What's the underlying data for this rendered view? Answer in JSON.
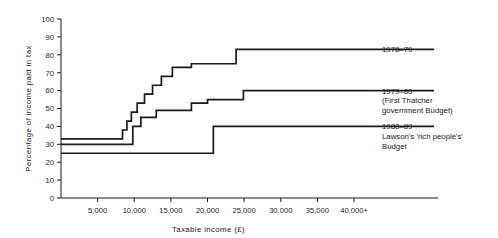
{
  "chart_data": {
    "type": "line",
    "subtype": "step",
    "title": "",
    "xlabel": "Taxable income (£)",
    "ylabel": "Percentage of income paid in tax",
    "grid": false,
    "legend_position": "right",
    "xlim": [
      0,
      43000
    ],
    "ylim": [
      0,
      100
    ],
    "yticks": [
      0,
      10,
      20,
      30,
      40,
      50,
      60,
      70,
      80,
      90,
      100
    ],
    "ytick_labels": [
      "0",
      "10",
      "20",
      "30",
      "40",
      "50",
      "60",
      "70",
      "80",
      "90",
      "100"
    ],
    "xticks": [
      5000,
      10000,
      15000,
      20000,
      25000,
      30000,
      35000,
      40000
    ],
    "xtick_labels": [
      "5,000",
      "10,000",
      "15,000",
      "20,000",
      "25,000",
      "30,000",
      "35,000",
      "40,000+"
    ],
    "series": [
      {
        "name": "1978–79",
        "legend_lines": [
          "1978–79"
        ],
        "steps": [
          {
            "x": 0,
            "y": 33
          },
          {
            "x": 8400,
            "y": 38
          },
          {
            "x": 9000,
            "y": 43
          },
          {
            "x": 9600,
            "y": 48
          },
          {
            "x": 10400,
            "y": 53
          },
          {
            "x": 11400,
            "y": 58
          },
          {
            "x": 12500,
            "y": 63
          },
          {
            "x": 13700,
            "y": 68
          },
          {
            "x": 15200,
            "y": 73
          },
          {
            "x": 17800,
            "y": 75
          },
          {
            "x": 23900,
            "y": 83
          },
          {
            "x": 43000,
            "y": 83
          }
        ],
        "plateau_value": 83,
        "start_value": 33
      },
      {
        "name": "1979–80",
        "legend_lines": [
          "1979–80",
          "(First Thatcher",
          "government Budget)"
        ],
        "steps": [
          {
            "x": 0,
            "y": 30
          },
          {
            "x": 9800,
            "y": 40
          },
          {
            "x": 10900,
            "y": 45
          },
          {
            "x": 13000,
            "y": 49
          },
          {
            "x": 17800,
            "y": 53
          },
          {
            "x": 20000,
            "y": 55
          },
          {
            "x": 24900,
            "y": 60
          },
          {
            "x": 43000,
            "y": 60
          }
        ],
        "plateau_value": 60,
        "start_value": 30
      },
      {
        "name": "1988–89",
        "legend_lines": [
          "1988–89",
          "Lawson's 'rich people's'",
          "Budget"
        ],
        "steps": [
          {
            "x": 0,
            "y": 25
          },
          {
            "x": 20800,
            "y": 40
          },
          {
            "x": 43000,
            "y": 40
          }
        ],
        "plateau_value": 40,
        "start_value": 25
      }
    ]
  },
  "legend": {
    "entries": [
      {
        "lines": [
          "1978–79"
        ]
      },
      {
        "lines": [
          "1979–80",
          "(First Thatcher",
          "government Budget)"
        ]
      },
      {
        "lines": [
          "1988–89",
          "Lawson's 'rich people's'",
          "Budget"
        ]
      }
    ]
  }
}
